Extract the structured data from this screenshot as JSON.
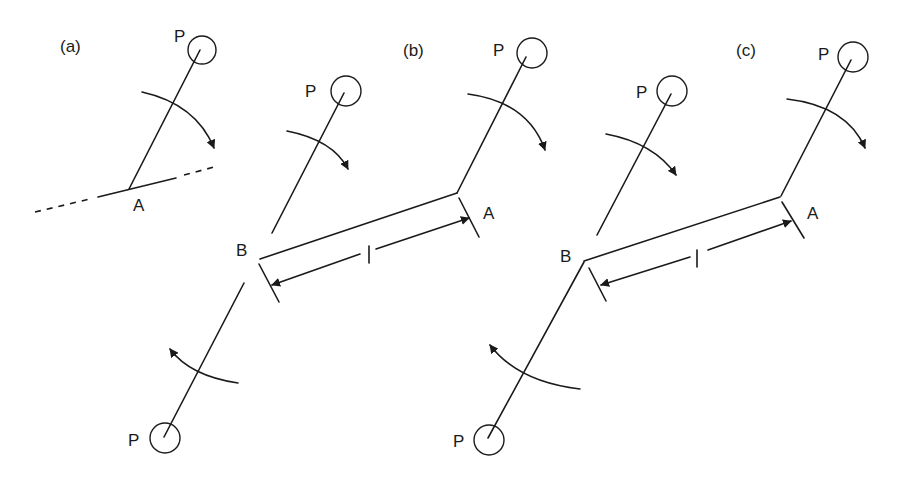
{
  "figure": {
    "panels": [
      {
        "id": "a",
        "label": "(a)",
        "points": {
          "P": "P",
          "A": "A"
        }
      },
      {
        "id": "b",
        "label": "(b)",
        "points": {
          "P_top": "P",
          "P_mid": "P",
          "P_bottom": "P",
          "A": "A",
          "B": "B"
        },
        "length_label": "l"
      },
      {
        "id": "c",
        "label": "(c)",
        "points": {
          "P_top": "P",
          "P_mid": "P",
          "P_bottom": "P",
          "A": "A",
          "B": "B"
        },
        "length_label": "l"
      }
    ],
    "colors": {
      "stroke": "#1a1a1a",
      "background": "#ffffff"
    }
  }
}
